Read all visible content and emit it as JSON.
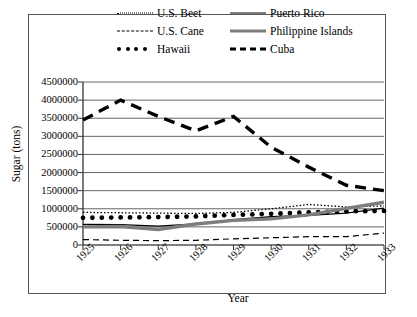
{
  "chart_data": {
    "type": "line",
    "title": "",
    "xlabel": "Year",
    "ylabel": "Sugar (tons)",
    "categories": [
      1925,
      1926,
      1927,
      1928,
      1929,
      1930,
      1931,
      1932,
      1933
    ],
    "xtick_labels": [
      "1925",
      "1926",
      "1927",
      "1928",
      "1929",
      "1930",
      "1931",
      "1932",
      "1933"
    ],
    "ytick_labels": [
      "4500000",
      "4000000",
      "3500000",
      "3000000",
      "2500000",
      "2000000",
      "1500000",
      "1000000",
      "500000",
      "0"
    ],
    "ylim": [
      0,
      4500000
    ],
    "ytick_step": 500000,
    "grid": "horizontal",
    "legend_position": "top",
    "series": [
      {
        "name": "U.S. Beet",
        "style": "dotted-thin",
        "color": "#000000",
        "values": [
          900000,
          890000,
          880000,
          870000,
          900000,
          1000000,
          1120000,
          1050000,
          1080000
        ]
      },
      {
        "name": "U.S. Cane",
        "style": "dashed-thin",
        "color": "#000000",
        "values": [
          150000,
          130000,
          120000,
          130000,
          170000,
          200000,
          230000,
          230000,
          330000
        ]
      },
      {
        "name": "Hawaii",
        "style": "dotted-marker",
        "color": "#000000",
        "values": [
          750000,
          760000,
          770000,
          790000,
          830000,
          860000,
          900000,
          930000,
          940000
        ]
      },
      {
        "name": "Puerto Rico",
        "style": "solid-thin",
        "color": "#000000",
        "values": [
          570000,
          560000,
          520000,
          580000,
          700000,
          780000,
          820000,
          880000,
          1020000
        ]
      },
      {
        "name": "Philippine Islands",
        "style": "solid-thick-gray",
        "color": "#7d7d7d",
        "values": [
          500000,
          510000,
          430000,
          580000,
          680000,
          720000,
          830000,
          1010000,
          1180000
        ]
      },
      {
        "name": "Cuba",
        "style": "dashed-thick",
        "color": "#000000",
        "values": [
          3450000,
          4000000,
          3550000,
          3150000,
          3550000,
          2700000,
          2150000,
          1650000,
          1500000
        ]
      }
    ]
  },
  "legend": {
    "items": [
      {
        "label": "U.S. Beet",
        "key": "dotted-thin-key"
      },
      {
        "label": "Puerto Rico",
        "key": "solid-thin-key"
      },
      {
        "label": "U.S. Cane",
        "key": "dashed-thin-key"
      },
      {
        "label": "Philippine Islands",
        "key": "solid-thick-gray-key"
      },
      {
        "label": "Hawaii",
        "key": "dotted-marker-key"
      },
      {
        "label": "Cuba",
        "key": "dashed-thick-key"
      }
    ]
  }
}
